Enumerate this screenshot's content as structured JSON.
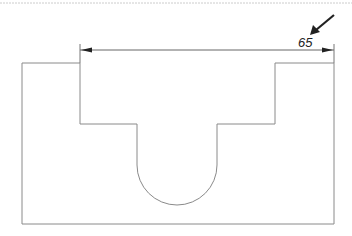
{
  "drawing": {
    "type": "technical-drawing",
    "description": "Front view of a block with a U-shaped channel and stepped recess",
    "dimension": {
      "label": "65",
      "feature": "width of top recess"
    },
    "pointer_arrow": "indicates dimension 65",
    "colors": {
      "outline": "#8a8a8a",
      "dimension_line": "#666666",
      "arrow": "#222222",
      "background": "#ffffff"
    }
  }
}
